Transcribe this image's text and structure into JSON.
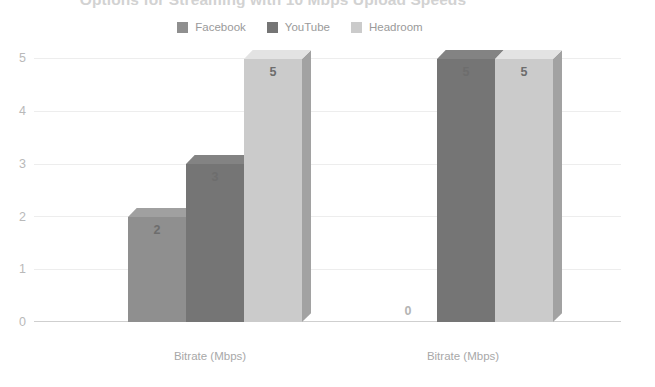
{
  "chart": {
    "title": "Options for Streaming with 10 Mbps Upload Speeds"
  },
  "legend": {
    "position": "top-center",
    "entries": [
      {
        "label": "Facebook",
        "color": "#8f8f8f",
        "icon": "legend-swatch-icon"
      },
      {
        "label": "YouTube",
        "color": "#757575",
        "icon": "legend-swatch-icon"
      },
      {
        "label": "Headroom",
        "color": "#cbcbcb",
        "icon": "legend-swatch-icon"
      }
    ]
  },
  "axis": {
    "y_ticks": [
      "5",
      "4",
      "3",
      "2",
      "1",
      "0"
    ],
    "x_labels": [
      "Bitrate (Mbps)",
      "Bitrate (Mbps)"
    ]
  },
  "bars": {
    "g0s0": "2",
    "g0s1": "3",
    "g0s2": "5",
    "g1s0": "0",
    "g1s1": "5",
    "g1s2": "5"
  },
  "chart_data": {
    "type": "bar",
    "title": "Options for Streaming with 10 Mbps Upload Speeds",
    "subtitle": "",
    "xlabel": "",
    "ylabel": "",
    "categories": [
      "Bitrate (Mbps)",
      "Bitrate (Mbps)"
    ],
    "series": [
      {
        "name": "Facebook",
        "color": "#8f8f8f",
        "values": [
          2,
          3
        ]
      },
      {
        "name": "YouTube",
        "color": "#757575",
        "values": [
          3,
          5
        ]
      },
      {
        "name": "Headroom",
        "color": "#cbcbcb",
        "values": [
          5,
          5
        ]
      }
    ],
    "note_on_layout": "Grouped 3D column chart; group 1 = Facebook 2, YouTube 3, Headroom 5; group 2 = Facebook 0, YouTube 5, Headroom 5",
    "groups": [
      {
        "label": "Bitrate (Mbps)",
        "values": {
          "Facebook": 2,
          "YouTube": 3,
          "Headroom": 5
        }
      },
      {
        "label": "Bitrate (Mbps)",
        "values": {
          "Facebook": 0,
          "YouTube": 5,
          "Headroom": 5
        }
      }
    ],
    "data_labels": [
      2,
      3,
      5,
      0,
      5,
      5
    ],
    "ylim": [
      0,
      5
    ],
    "yticks": [
      0,
      1,
      2,
      3,
      4,
      5
    ],
    "grid": true,
    "legend_position": "top",
    "style": "3d-columns-grayscale"
  }
}
